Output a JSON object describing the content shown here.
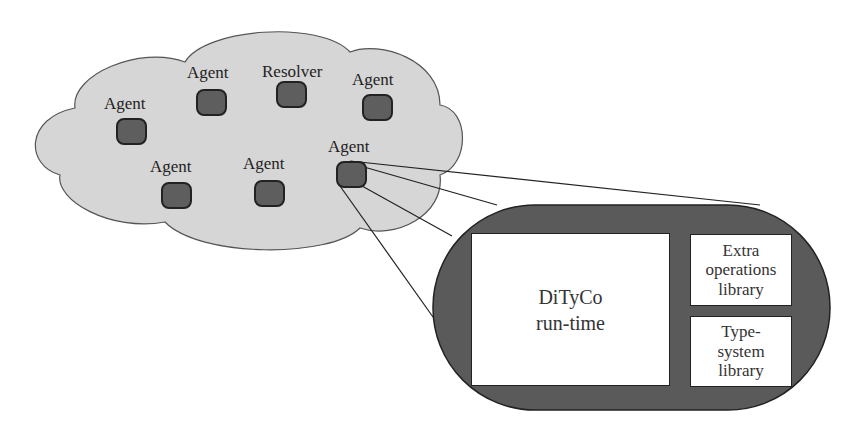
{
  "diagram": {
    "cloud_nodes": [
      {
        "label": "Agent",
        "x": 104,
        "y": 95,
        "node_x": 116,
        "node_y": 118
      },
      {
        "label": "Agent",
        "x": 187,
        "y": 64,
        "node_x": 196,
        "node_y": 89
      },
      {
        "label": "Resolver",
        "x": 262,
        "y": 63,
        "node_x": 276,
        "node_y": 81
      },
      {
        "label": "Agent",
        "x": 352,
        "y": 71,
        "node_x": 362,
        "node_y": 94
      },
      {
        "label": "Agent",
        "x": 150,
        "y": 158,
        "node_x": 161,
        "node_y": 182
      },
      {
        "label": "Agent",
        "x": 243,
        "y": 155,
        "node_x": 254,
        "node_y": 180
      },
      {
        "label": "Agent",
        "x": 328,
        "y": 138,
        "node_x": 336,
        "node_y": 161
      }
    ],
    "expanded_agent": {
      "runtime_label": [
        "DiTyCo",
        "run-time"
      ],
      "extra_ops_label": [
        "Extra",
        "operations",
        "library"
      ],
      "type_system_label": [
        "Type-",
        "system",
        "library"
      ]
    },
    "colors": {
      "cloud_fill": "#d6d6d6",
      "node_fill": "#5e5e5e",
      "capsule_fill": "#5a5a5a",
      "stroke": "#222222"
    }
  }
}
